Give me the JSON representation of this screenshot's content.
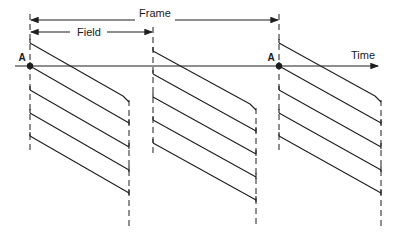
{
  "diagram": {
    "type": "interlaced-scan-timing",
    "labels": {
      "frame": "Frame",
      "field": "Field",
      "time": "Time",
      "point_a_left": "A",
      "point_a_right": "A"
    },
    "colors": {
      "ink": "#1e1e1e",
      "background": "#ffffff"
    },
    "geometry": {
      "time_axis_y": 66,
      "time_axis_x": [
        15,
        380
      ],
      "frame_arrow": {
        "y": 20,
        "x": [
          30,
          279
        ]
      },
      "field_arrow": {
        "y": 32,
        "x": [
          30,
          153
        ]
      },
      "field_boundaries_x": [
        30,
        129,
        153,
        256,
        279,
        381
      ],
      "fields": [
        {
          "name": "field-1",
          "x_start": 30,
          "x_end": 129,
          "line_start_y": [
            43,
            66,
            90,
            113,
            136
          ]
        },
        {
          "name": "field-2",
          "x_start": 153,
          "x_end": 256,
          "line_start_y": [
            51,
            74,
            97,
            120,
            143
          ]
        },
        {
          "name": "field-3",
          "x_start": 279,
          "x_end": 381,
          "line_start_y": [
            43,
            66,
            90,
            113,
            136
          ]
        }
      ],
      "scan_line_drop": 57,
      "point_a": [
        {
          "x": 30,
          "y": 66
        },
        {
          "x": 279,
          "y": 66
        }
      ]
    }
  }
}
